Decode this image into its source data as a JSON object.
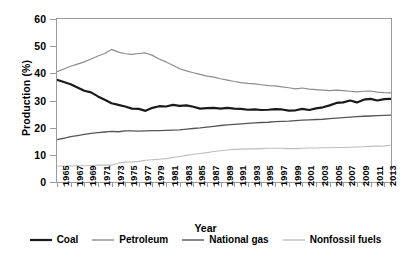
{
  "chart_data": {
    "type": "line",
    "title": "",
    "xlabel": "Year",
    "ylabel": "Production (%)",
    "xlim": [
      1965,
      2014
    ],
    "ylim": [
      0,
      60
    ],
    "yticks": [
      0,
      10,
      20,
      30,
      40,
      50,
      60
    ],
    "grid": false,
    "legend_position": "bottom",
    "x": [
      1965,
      1966,
      1967,
      1968,
      1969,
      1970,
      1971,
      1972,
      1973,
      1974,
      1975,
      1976,
      1977,
      1978,
      1979,
      1980,
      1981,
      1982,
      1983,
      1984,
      1985,
      1986,
      1987,
      1988,
      1989,
      1990,
      1991,
      1992,
      1993,
      1994,
      1995,
      1996,
      1997,
      1998,
      1999,
      2000,
      2001,
      2002,
      2003,
      2004,
      2005,
      2006,
      2007,
      2008,
      2009,
      2010,
      2011,
      2012,
      2013,
      2014
    ],
    "xtick_labels": [
      "1965",
      "1967",
      "1969",
      "1971",
      "1973",
      "1975",
      "1977",
      "1979",
      "1981",
      "1983",
      "1985",
      "1987",
      "1989",
      "1991",
      "1993",
      "1995",
      "1997",
      "1999",
      "2001",
      "2003",
      "2005",
      "2007",
      "2009",
      "2011",
      "2013"
    ],
    "series": [
      {
        "name": "Coal",
        "color": "#1a1a1a",
        "width": 2.2,
        "values": [
          37.6,
          36.8,
          36.0,
          34.8,
          33.6,
          33.0,
          31.5,
          30.3,
          29.0,
          28.4,
          27.8,
          27.0,
          26.9,
          26.2,
          27.3,
          27.9,
          27.8,
          28.4,
          28.0,
          28.2,
          27.7,
          27.0,
          27.2,
          27.3,
          27.0,
          27.3,
          27.0,
          26.9,
          26.6,
          26.7,
          26.5,
          26.6,
          26.8,
          26.7,
          26.3,
          26.4,
          26.9,
          26.5,
          27.1,
          27.5,
          28.2,
          29.1,
          29.3,
          30.0,
          29.3,
          30.3,
          30.6,
          30.0,
          30.5,
          30.6
        ]
      },
      {
        "name": "Petroleum",
        "color": "#8c8c8c",
        "width": 1.2,
        "values": [
          40.6,
          41.6,
          42.6,
          43.4,
          44.2,
          45.3,
          46.4,
          47.3,
          48.8,
          47.8,
          47.2,
          47.0,
          47.3,
          47.5,
          46.6,
          45.3,
          44.2,
          43.0,
          41.7,
          40.9,
          40.2,
          39.6,
          39.0,
          38.6,
          38.0,
          37.5,
          37.0,
          36.6,
          36.3,
          36.1,
          35.8,
          35.5,
          35.4,
          35.0,
          34.7,
          34.3,
          34.6,
          34.2,
          34.0,
          33.8,
          33.6,
          33.8,
          33.6,
          33.4,
          33.2,
          33.4,
          33.5,
          33.1,
          32.9,
          32.8
        ]
      },
      {
        "name": "National gas",
        "color": "#555555",
        "width": 1.3,
        "values": [
          15.6,
          16.1,
          16.7,
          17.1,
          17.5,
          17.9,
          18.2,
          18.4,
          18.6,
          18.5,
          18.8,
          18.8,
          18.7,
          18.8,
          18.9,
          18.9,
          19.0,
          19.1,
          19.2,
          19.5,
          19.7,
          19.9,
          20.2,
          20.5,
          20.8,
          21.0,
          21.2,
          21.4,
          21.6,
          21.8,
          21.9,
          22.0,
          22.2,
          22.3,
          22.4,
          22.6,
          22.8,
          22.9,
          23.0,
          23.1,
          23.3,
          23.5,
          23.7,
          23.9,
          24.1,
          24.2,
          24.3,
          24.4,
          24.5,
          24.6
        ]
      },
      {
        "name": "Nonfossil fuels",
        "color": "#bdbdbd",
        "width": 1.1,
        "values": [
          5.9,
          5.9,
          5.9,
          6.0,
          6.0,
          6.1,
          6.2,
          6.2,
          6.2,
          7.0,
          7.3,
          7.4,
          7.6,
          8.0,
          8.2,
          8.4,
          8.6,
          9.0,
          9.4,
          9.8,
          10.2,
          10.5,
          10.8,
          11.2,
          11.5,
          11.8,
          12.0,
          12.1,
          12.2,
          12.2,
          12.3,
          12.4,
          12.4,
          12.4,
          12.3,
          12.3,
          12.4,
          12.5,
          12.5,
          12.6,
          12.6,
          12.7,
          12.7,
          12.8,
          12.9,
          13.0,
          13.1,
          13.2,
          13.3,
          13.5
        ]
      }
    ]
  },
  "legend": {
    "items": [
      {
        "label": "Coal"
      },
      {
        "label": "Petroleum"
      },
      {
        "label": "National gas"
      },
      {
        "label": "Nonfossil fuels"
      }
    ]
  }
}
